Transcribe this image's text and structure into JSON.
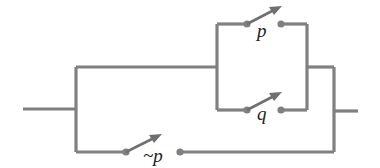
{
  "diagram": {
    "type": "switching-circuit",
    "colors": {
      "wire": "#808080",
      "label": "#222222",
      "background": "#ffffff"
    },
    "switches": [
      {
        "id": "p",
        "label": "p",
        "branch": "upper-parallel"
      },
      {
        "id": "q",
        "label": "q",
        "branch": "lower-parallel"
      },
      {
        "id": "not-p",
        "label": "~p",
        "branch": "bottom-bypass"
      }
    ]
  }
}
